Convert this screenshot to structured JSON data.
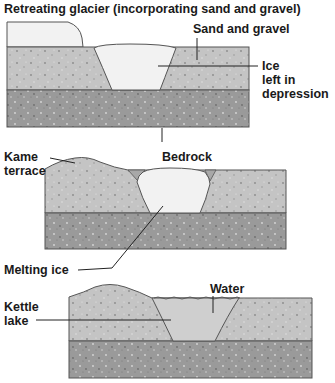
{
  "title": "Retreating glacier (incorporating sand and gravel)",
  "panels": [
    {
      "id": "stage-1",
      "labels": {
        "sand_gravel": "Sand and gravel",
        "ice_line1": "Ice",
        "ice_line2": "left in",
        "ice_line3": "depression",
        "bedrock": "Bedrock"
      }
    },
    {
      "id": "stage-2",
      "labels": {
        "kame_line1": "Kame",
        "kame_line2": "terrace",
        "melting_ice": "Melting ice"
      }
    },
    {
      "id": "stage-3",
      "labels": {
        "water": "Water",
        "kettle_line1": "Kettle",
        "kettle_line2": "lake"
      }
    }
  ],
  "colors": {
    "sand_gravel": "#c4c4c4",
    "bedrock": "#9a9a9a",
    "ice": "#f2f2f2",
    "water": "#cfcfcf",
    "outline": "#555555",
    "text": "#1a1a1a"
  }
}
